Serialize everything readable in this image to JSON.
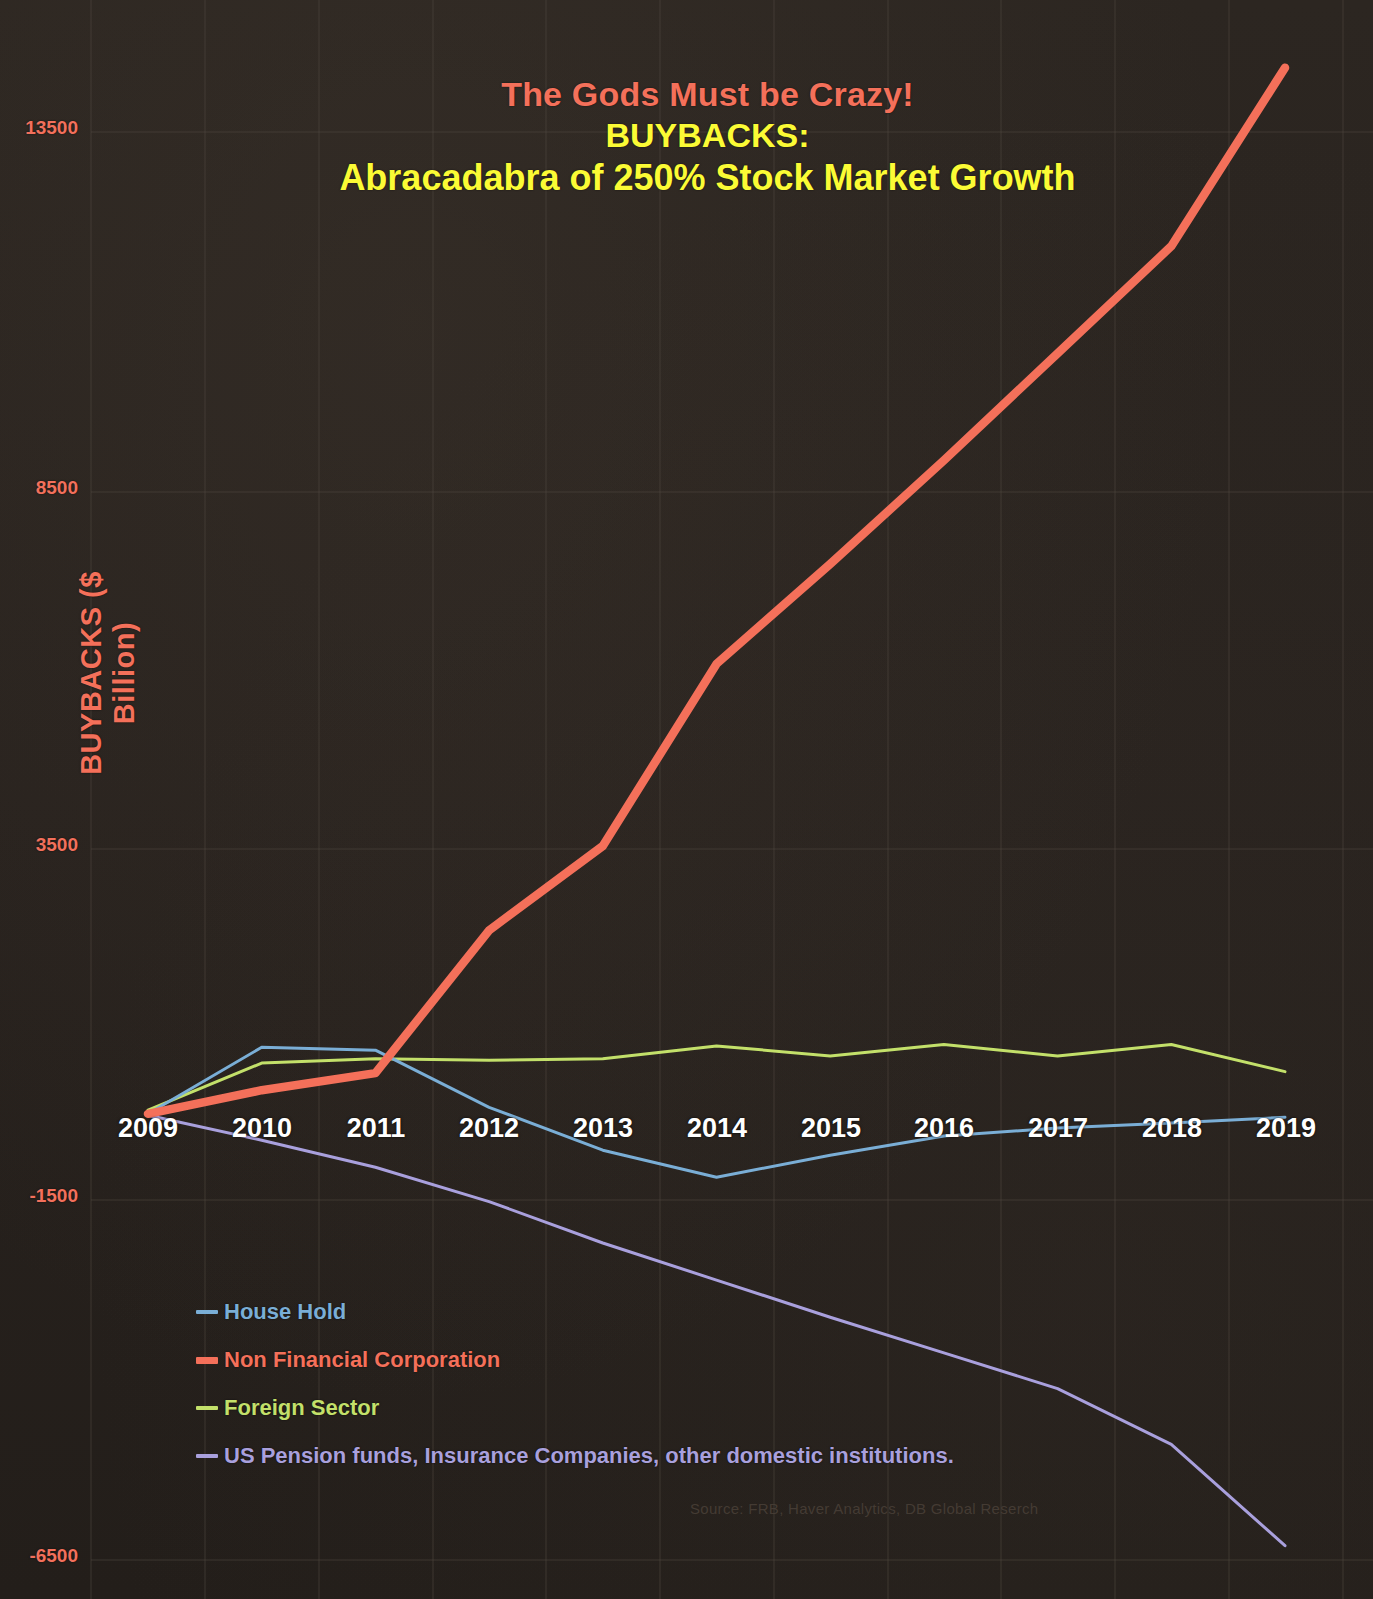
{
  "titles": {
    "line1": "The Gods Must be Crazy!",
    "line2": "BUYBACKS:",
    "line3": "Abracadabra of 250% Stock Market Growth",
    "line1_color": "#f4705a",
    "line2_color": "#fbfb35"
  },
  "axis": {
    "ylabel": "BUYBACKS ($ Billion)",
    "yticks": [
      "13500",
      "8500",
      "3500",
      "-1500",
      "-6500"
    ],
    "xticks": [
      "2009",
      "2010",
      "2011",
      "2012",
      "2013",
      "2014",
      "2015",
      "2016",
      "2017",
      "2018",
      "2019"
    ]
  },
  "legend": [
    {
      "label": "House Hold",
      "color": "#7aaed6"
    },
    {
      "label": "Non Financial Corporation",
      "color": "#f4705a"
    },
    {
      "label": "Foreign Sector",
      "color": "#c3e06a"
    },
    {
      "label": "US Pension funds, Insurance Companies, other domestic institutions.",
      "color": "#a9a0dd"
    }
  ],
  "source": "Source: FRB, Haver Analytics, DB Global Reserch",
  "chart_data": {
    "type": "line",
    "title": "The Gods Must be Crazy! BUYBACKS: Abracadabra of 250% Stock Market Growth",
    "xlabel": "",
    "ylabel": "BUYBACKS ($ Billion)",
    "x": [
      2009,
      2010,
      2011,
      2012,
      2013,
      2014,
      2015,
      2016,
      2017,
      2018,
      2019
    ],
    "ylim": [
      -6500,
      14400
    ],
    "xlim": [
      2009,
      2019
    ],
    "ytick_values": [
      13500,
      8500,
      3500,
      -1500,
      -6500
    ],
    "grid": true,
    "legend_position": "lower-left",
    "series": [
      {
        "name": "House Hold",
        "color": "#7aaed6",
        "values": [
          -250,
          680,
          640,
          -160,
          -760,
          -1140,
          -830,
          -560,
          -450,
          -380,
          -300
        ]
      },
      {
        "name": "Non Financial Corporation",
        "color": "#f4705a",
        "values": [
          -250,
          80,
          320,
          2320,
          3500,
          6050,
          7450,
          8900,
          10400,
          11900,
          14400
        ]
      },
      {
        "name": "Foreign Sector",
        "color": "#c3e06a",
        "values": [
          -200,
          460,
          520,
          500,
          520,
          700,
          560,
          720,
          560,
          720,
          340
        ]
      },
      {
        "name": "US Pension funds, Insurance Companies, other domestic institutions.",
        "color": "#a9a0dd",
        "values": [
          -270,
          -620,
          -1000,
          -1480,
          -2060,
          -2580,
          -3100,
          -3600,
          -4100,
          -4880,
          -6300
        ]
      }
    ]
  }
}
